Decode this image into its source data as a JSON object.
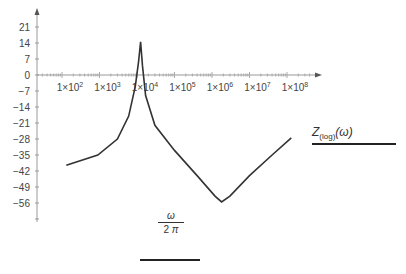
{
  "chart_data": {
    "type": "line",
    "title": "",
    "xscale": "log",
    "xlabel": "ω / 2π",
    "ylabel": "",
    "legend": [
      {
        "name": "Z(log)(ω)",
        "color": "#222222"
      }
    ],
    "legend_position": "right",
    "grid": false,
    "x_tick_labels": [
      "1×10²",
      "1×10³",
      "1×10⁴",
      "1×10⁵",
      "1×10⁶",
      "1×10⁷",
      "1×10⁸"
    ],
    "y_ticks": [
      21,
      14,
      7,
      0,
      -7,
      -14,
      -21,
      -28,
      -35,
      -42,
      -49,
      -56
    ],
    "xlim": [
      50,
      300000000
    ],
    "ylim": [
      -63,
      28
    ],
    "series": [
      {
        "name": "Z(log)(ω)",
        "x": [
          130,
          900,
          3000,
          6000,
          9000,
          11000,
          12500,
          14000,
          17000,
          30000,
          100000,
          400000,
          1200000,
          1800000,
          3000000,
          10000000,
          40000000,
          130000000
        ],
        "y": [
          -39.5,
          -35,
          -28,
          -18,
          -5,
          6,
          14.5,
          4,
          -9,
          -22,
          -33,
          -44,
          -53,
          -55.5,
          -53,
          -44,
          -35,
          -27.5
        ]
      }
    ]
  },
  "labels": {
    "legend": {
      "main": "Z",
      "sub": "(log)",
      "arg": "(ω)"
    },
    "xaxis": {
      "numerator": "ω",
      "denominator_num": "2",
      "denominator_sym": "π"
    }
  },
  "y_tick_text": [
    "21",
    "14",
    "7",
    "0",
    "−7",
    "−14",
    "−21",
    "−28",
    "−35",
    "−42",
    "−49",
    "−56"
  ],
  "x_tick_text": [
    {
      "base": "1×10",
      "exp": "2"
    },
    {
      "base": "1×10",
      "exp": "3"
    },
    {
      "base": "1×10",
      "exp": "4"
    },
    {
      "base": "1×10",
      "exp": "5"
    },
    {
      "base": "1×10",
      "exp": "6"
    },
    {
      "base": "1×10",
      "exp": "7"
    },
    {
      "base": "1×10",
      "exp": "8"
    }
  ]
}
